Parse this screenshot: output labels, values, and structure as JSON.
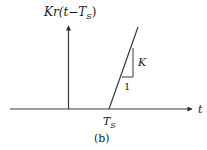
{
  "figure": {
    "caption": "(b)",
    "y_axis_label": {
      "prefix": "Kr(",
      "t": "t",
      "minus": "−",
      "T": "T",
      "sub": "S",
      "close": ")"
    },
    "x_axis_label": "t",
    "ramp_start_label": {
      "T": "T",
      "sub": "S"
    },
    "slope_triangle": {
      "rise_label": "K",
      "run_label": "1"
    },
    "colors": {
      "stroke": "#3a3a3a",
      "text": "#1a1a1a",
      "background": "#ffffff"
    }
  }
}
